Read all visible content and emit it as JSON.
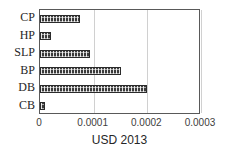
{
  "chart_data": {
    "type": "bar",
    "orientation": "horizontal",
    "title": "",
    "xlabel": "USD 2013",
    "ylabel": "",
    "categories": [
      "CP",
      "HP",
      "SLP",
      "BP",
      "DB",
      "CB"
    ],
    "values": [
      7.4e-05,
      2e-05,
      9.4e-05,
      0.00015,
      0.0002,
      1e-05
    ],
    "xlim": [
      0,
      0.0003
    ],
    "xticks": [
      0,
      0.0001,
      0.0002,
      0.0003
    ],
    "xticklabels": [
      "0",
      "0.0001",
      "0.0002",
      "0.0003"
    ],
    "grid": "vertical",
    "legend": "none",
    "bar_color": "#3b3b3b",
    "bar_pattern": "dotted-hatch",
    "gridline_color": "#d0d0d0",
    "frame_color": "#595959",
    "background_color": "#ffffff"
  }
}
